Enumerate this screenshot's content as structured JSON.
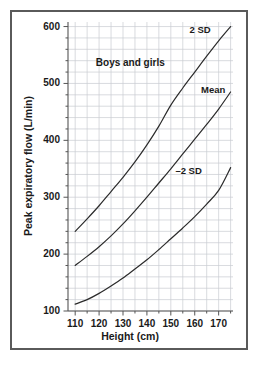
{
  "chart_data": {
    "type": "line",
    "title": "",
    "annotation": "Boys and girls",
    "xlabel": "Height (cm)",
    "ylabel": "Peak expiratory flow (L/min)",
    "xlim": [
      107,
      176
    ],
    "ylim": [
      100,
      608
    ],
    "grid": true,
    "grid_x_step": 5,
    "grid_y_step": 20,
    "xticks": [
      110,
      120,
      130,
      140,
      150,
      160,
      170
    ],
    "xtick_labels": [
      "110",
      "120",
      "130",
      "140",
      "150",
      "160",
      "170"
    ],
    "yticks": [
      100,
      200,
      300,
      400,
      500,
      600
    ],
    "ytick_labels": [
      "100",
      "200",
      "300",
      "400",
      "500",
      "600"
    ],
    "x_minor_tick_step": 5,
    "y_minor_tick_step": 20,
    "legend_position": "inline-labels",
    "line_color": "#2b2b2b",
    "grid_color": "#c9ccd1",
    "axis_color": "#555555",
    "frame_color": "#5a5a5a",
    "x": [
      110,
      115,
      120,
      125,
      130,
      135,
      140,
      145,
      150,
      155,
      160,
      165,
      170,
      175
    ],
    "series": [
      {
        "name": "2 SD",
        "label": "2 SD",
        "values": [
          240,
          262,
          285,
          310,
          335,
          362,
          392,
          425,
          462,
          492,
          520,
          548,
          575,
          600
        ]
      },
      {
        "name": "Mean",
        "label": "Mean",
        "values": [
          180,
          196,
          213,
          232,
          253,
          276,
          300,
          325,
          350,
          376,
          402,
          428,
          455,
          485
        ]
      },
      {
        "name": "-2 SD",
        "label": "–2 SD",
        "values": [
          112,
          120,
          131,
          144,
          158,
          174,
          190,
          208,
          227,
          246,
          266,
          288,
          312,
          352
        ]
      }
    ]
  }
}
